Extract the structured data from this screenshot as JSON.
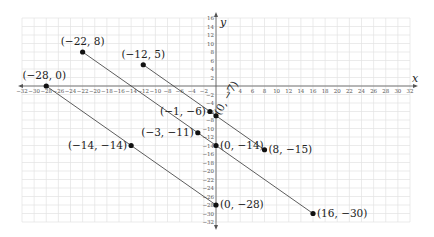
{
  "chart_data": {
    "type": "line",
    "title": "",
    "xlabel": "x",
    "ylabel": "y",
    "xlim": [
      -32,
      32
    ],
    "ylim": [
      -32,
      16
    ],
    "grid": true,
    "x_ticks": [
      -32,
      -30,
      -28,
      -26,
      -24,
      -22,
      -20,
      -18,
      -16,
      -14,
      -12,
      -10,
      -8,
      -6,
      -4,
      -2,
      2,
      4,
      6,
      8,
      10,
      12,
      14,
      16,
      18,
      20,
      22,
      24,
      26,
      28,
      30,
      32
    ],
    "y_ticks": [
      16,
      14,
      12,
      10,
      8,
      6,
      4,
      2,
      -2,
      -4,
      -6,
      -8,
      -10,
      -12,
      -14,
      -16,
      -18,
      -20,
      -22,
      -24,
      -26,
      -28,
      -30,
      -32
    ],
    "series": [
      {
        "name": "segment-1",
        "points": [
          [
            -12,
            5
          ],
          [
            -1,
            -6
          ],
          [
            0,
            -7
          ],
          [
            8,
            -15
          ]
        ]
      },
      {
        "name": "segment-2",
        "points": [
          [
            -22,
            8
          ],
          [
            -3,
            -11
          ],
          [
            0,
            -14
          ],
          [
            16,
            -30
          ]
        ]
      },
      {
        "name": "segment-3",
        "points": [
          [
            -28,
            0
          ],
          [
            -14,
            -14
          ],
          [
            0,
            -28
          ]
        ]
      }
    ],
    "labeled_points": [
      {
        "x": -22,
        "y": 8,
        "label": "(−22, 8)"
      },
      {
        "x": -12,
        "y": 5,
        "label": "(−12, 5)"
      },
      {
        "x": -28,
        "y": 0,
        "label": "(−28, 0)"
      },
      {
        "x": -1,
        "y": -6,
        "label": "(−1, −6)"
      },
      {
        "x": 0,
        "y": -7,
        "label": "(0, −7)"
      },
      {
        "x": -3,
        "y": -11,
        "label": "(−3, −11)"
      },
      {
        "x": 0,
        "y": -14,
        "label": "(0, −14)"
      },
      {
        "x": 8,
        "y": -15,
        "label": "(8, −15)"
      },
      {
        "x": -14,
        "y": -14,
        "label": "(−14, −14)"
      },
      {
        "x": 0,
        "y": -28,
        "label": "(0, −28)"
      },
      {
        "x": 16,
        "y": -30,
        "label": "(16, −30)"
      }
    ]
  }
}
